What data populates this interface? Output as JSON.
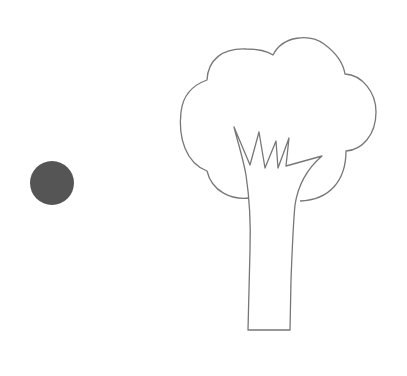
{
  "scene": {
    "width": 407,
    "height": 376,
    "background": "#ffffff",
    "dot": {
      "cx": 52,
      "cy": 183,
      "r": 22,
      "fill": "#555555"
    },
    "tree": {
      "stroke": "#777777",
      "stroke_width": 1.3,
      "fill": "#ffffff"
    }
  }
}
